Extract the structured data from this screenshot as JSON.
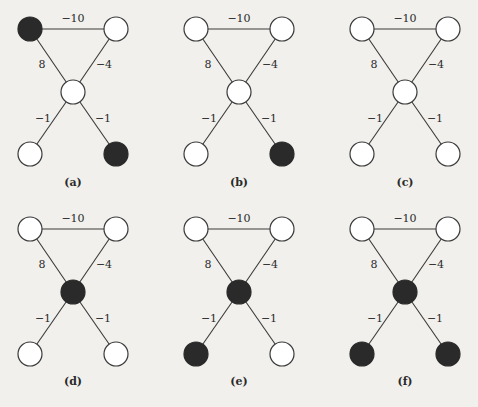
{
  "figure": {
    "colors": {
      "background": "#f1f0ec",
      "edge": "#3a3a3a",
      "filled_node": "#2a2a2a",
      "empty_node": "#ffffff"
    },
    "graph": {
      "nodes": [
        "top-left",
        "top-right",
        "center",
        "bottom-left",
        "bottom-right"
      ],
      "edges": [
        {
          "from": "top-left",
          "to": "top-right",
          "weight": "−10"
        },
        {
          "from": "top-left",
          "to": "center",
          "weight": "8"
        },
        {
          "from": "top-right",
          "to": "center",
          "weight": "−4"
        },
        {
          "from": "center",
          "to": "bottom-left",
          "weight": "−1"
        },
        {
          "from": "center",
          "to": "bottom-right",
          "weight": "−1"
        }
      ]
    },
    "panels": [
      {
        "label": "(a)",
        "filled": [
          "top-left",
          "bottom-right"
        ]
      },
      {
        "label": "(b)",
        "filled": [
          "bottom-right"
        ]
      },
      {
        "label": "(c)",
        "filled": []
      },
      {
        "label": "(d)",
        "filled": [
          "center"
        ]
      },
      {
        "label": "(e)",
        "filled": [
          "center",
          "bottom-left"
        ]
      },
      {
        "label": "(f)",
        "filled": [
          "center",
          "bottom-left",
          "bottom-right"
        ]
      }
    ],
    "caption": ""
  }
}
